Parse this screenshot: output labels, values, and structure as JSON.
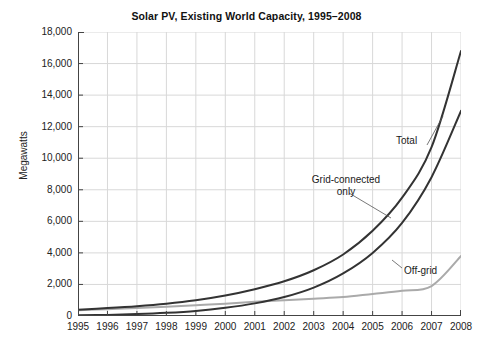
{
  "chart_data": {
    "type": "line",
    "title": "Solar PV, Existing World Capacity, 1995–2008",
    "xlabel": "",
    "ylabel": "Megawatts",
    "x": [
      1995,
      1996,
      1997,
      1998,
      1999,
      2000,
      2001,
      2002,
      2003,
      2004,
      2005,
      2006,
      2007,
      2008
    ],
    "xticklabels": [
      "1995",
      "1996",
      "1997",
      "1998",
      "1999",
      "2000",
      "2001",
      "2002",
      "2003",
      "2004",
      "2005",
      "2006",
      "2007",
      "2008"
    ],
    "yticklabels": [
      "0",
      "2,000",
      "4,000",
      "6,000",
      "8,000",
      "10,000",
      "12,000",
      "14,000",
      "16,000",
      "18,000"
    ],
    "ytickvalues": [
      0,
      2000,
      4000,
      6000,
      8000,
      10000,
      12000,
      14000,
      16000,
      18000
    ],
    "xlim": [
      1995,
      2008
    ],
    "ylim": [
      0,
      18000
    ],
    "grid": true,
    "legend_position": "inline-annotations",
    "series": [
      {
        "name": "Total",
        "label": "Total",
        "color": "#333333",
        "width": 2.0,
        "values": [
          400,
          500,
          620,
          780,
          1000,
          1300,
          1700,
          2200,
          2900,
          3900,
          5400,
          7500,
          10700,
          16800
        ]
      },
      {
        "name": "Grid-connected only",
        "label": "Grid-connected\nonly",
        "color": "#333333",
        "width": 2.0,
        "values": [
          40,
          70,
          120,
          200,
          320,
          520,
          800,
          1200,
          1800,
          2700,
          4000,
          5900,
          8800,
          13000
        ]
      },
      {
        "name": "Off-grid",
        "label": "Off-grid",
        "color": "#aaaaaa",
        "width": 2.0,
        "values": [
          360,
          430,
          500,
          580,
          680,
          780,
          900,
          1000,
          1100,
          1200,
          1400,
          1600,
          1900,
          3800
        ]
      }
    ],
    "annotations": [
      {
        "text": "Total",
        "series": "Total"
      },
      {
        "text": "Grid-connected\nonly",
        "series": "Grid-connected only"
      },
      {
        "text": "Off-grid",
        "series": "Off-grid"
      }
    ],
    "colors": {
      "axis": "#444444",
      "grid": "#d8d8d8",
      "dark_line": "#333333",
      "light_line": "#aaaaaa",
      "text": "#1a1a1a",
      "background": "#ffffff"
    }
  }
}
